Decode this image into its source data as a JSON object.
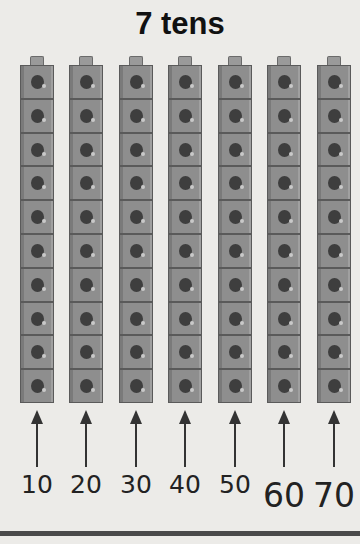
{
  "title": "7 tens",
  "columns": [
    {
      "label": "10",
      "x": 20
    },
    {
      "label": "20",
      "x": 69
    },
    {
      "label": "30",
      "x": 119
    },
    {
      "label": "40",
      "x": 168
    },
    {
      "label": "50",
      "x": 218
    },
    {
      "label": "60",
      "x": 267
    },
    {
      "label": "70",
      "x": 317
    }
  ],
  "cubes_per_column": 10,
  "colors": {
    "cube": "#8e8e8e",
    "hole": "#3e3e3e",
    "text": "#111111",
    "background": "#ecebe8"
  }
}
